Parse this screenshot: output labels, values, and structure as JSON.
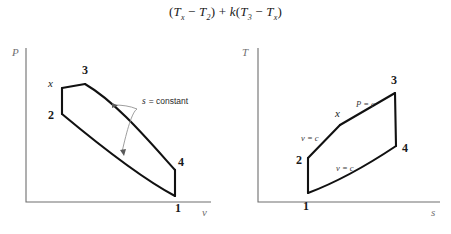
{
  "equation": {
    "full_text": "(Tx − T2) + k(T3 − Tx)",
    "term1_open": "(",
    "t_a": "T",
    "t_a_sub": "x",
    "minus1": "−",
    "t_b": "T",
    "t_b_sub": "2",
    "term1_close": ")",
    "plus": "+",
    "k": "k",
    "term2_open": "(",
    "t_c": "T",
    "t_c_sub": "3",
    "minus2": "−",
    "t_d": "T",
    "t_d_sub": "x",
    "term2_close": ")"
  },
  "diagrams": [
    {
      "id": "pv-diagram",
      "name": "pressure-volume-diagram",
      "y_axis_label": "P",
      "x_axis_label": "v",
      "state_labels": [
        {
          "key": "x",
          "text": "x",
          "style": "italic"
        },
        {
          "key": "3",
          "text": "3",
          "style": "bold"
        },
        {
          "key": "2",
          "text": "2",
          "style": "bold"
        },
        {
          "key": "4",
          "text": "4",
          "style": "bold"
        },
        {
          "key": "1",
          "text": "1",
          "style": "bold"
        }
      ],
      "annotations": [
        {
          "key": "s-constant",
          "symbol": "s",
          "text": "= constant"
        }
      ]
    },
    {
      "id": "ts-diagram",
      "name": "temperature-entropy-diagram",
      "y_axis_label": "T",
      "x_axis_label": "s",
      "state_labels": [
        {
          "key": "3",
          "text": "3",
          "style": "bold"
        },
        {
          "key": "x",
          "text": "x",
          "style": "italic"
        },
        {
          "key": "2",
          "text": "2",
          "style": "bold"
        },
        {
          "key": "4",
          "text": "4",
          "style": "bold"
        },
        {
          "key": "1",
          "text": "1",
          "style": "bold"
        }
      ],
      "process_labels": [
        {
          "key": "p-const",
          "text": "P = c"
        },
        {
          "key": "v-const-upper",
          "text": "v = c"
        },
        {
          "key": "v-const-lower",
          "text": "v = c"
        }
      ]
    }
  ],
  "colors": {
    "cycle_line": "#111111",
    "axis_line": "#6e6e6e",
    "leader_line": "#8c8c8c",
    "text": "#1a1a1a",
    "axis_label": "#707070",
    "background": "#ffffff"
  }
}
